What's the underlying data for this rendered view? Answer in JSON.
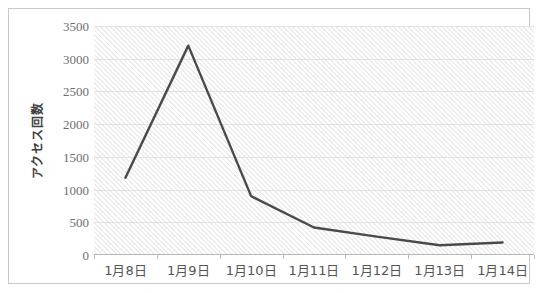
{
  "chart_data": {
    "type": "line",
    "title": "",
    "xlabel": "",
    "ylabel": "アクセス回数",
    "categories": [
      "1月8日",
      "1月9日",
      "1月10日",
      "1月11日",
      "1月12日",
      "1月13日",
      "1月14日"
    ],
    "values": [
      1180,
      3200,
      900,
      420,
      280,
      150,
      190
    ],
    "series": [
      {
        "name": "アクセス回数",
        "values": [
          1180,
          3200,
          900,
          420,
          280,
          150,
          190
        ]
      }
    ],
    "ylim": [
      0,
      3500
    ],
    "ytick_values": [
      0,
      500,
      1000,
      1500,
      2000,
      2500,
      3000,
      3500
    ],
    "ytick_labels": [
      "0",
      "500",
      "1000",
      "1500",
      "2000",
      "2500",
      "3000",
      "3500"
    ],
    "grid": true,
    "legend": false,
    "legend_position": "none",
    "line_color": "#4a4a4a",
    "plot_background_color": "#fbfbfb",
    "grid_color": "#e2e2e2",
    "border_color": "#c9c9c9"
  }
}
